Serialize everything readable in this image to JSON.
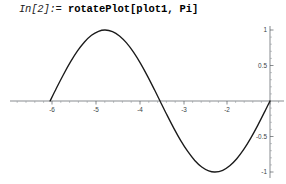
{
  "window": {
    "title": "Mathematica Notebook Cell",
    "background_color": "#ffffff"
  },
  "input_cell": {
    "prompt": "In[2]:=",
    "expression": "rotatePlot[plot1, Pi]",
    "prompt_color": "#1a1a1a",
    "expression_color": "#000000"
  },
  "chart_data": {
    "type": "line",
    "title": "",
    "subtitle": "",
    "xlabel": "",
    "ylabel": "",
    "function": "-sin(x)",
    "xlim": [
      -6.6,
      0.15
    ],
    "ylim": [
      -1.08,
      1.08
    ],
    "xticks": [
      -6,
      -5,
      -4,
      -3,
      -2,
      -1
    ],
    "xtick_labels": [
      "-6",
      "-5",
      "-4",
      "-3",
      "-2",
      "-1"
    ],
    "yticks": [
      1,
      0.5,
      -0.5,
      -1
    ],
    "ytick_labels": [
      "1",
      "0.5",
      "-0.5",
      "-1"
    ],
    "grid": false,
    "legend": "none",
    "axis_color": "#555a5e",
    "curve_color": "#1a1a1a",
    "x": [
      -6.283,
      -6.1,
      -5.9,
      -5.7,
      -5.5,
      -5.3,
      -5.1,
      -4.9,
      -4.712,
      -4.5,
      -4.3,
      -4.1,
      -3.9,
      -3.7,
      -3.5,
      -3.3,
      -3.142,
      -2.95,
      -2.75,
      -2.55,
      -2.35,
      -2.15,
      -1.95,
      -1.75,
      -1.571,
      -1.35,
      -1.15,
      -0.95,
      -0.75,
      -0.55,
      -0.35,
      -0.15,
      0
    ],
    "values": [
      0.0,
      0.183,
      0.374,
      0.551,
      0.706,
      0.832,
      0.926,
      0.982,
      1.0,
      0.978,
      0.916,
      0.818,
      0.688,
      0.53,
      0.351,
      0.158,
      0.0,
      -0.191,
      -0.382,
      -0.558,
      -0.711,
      -0.837,
      -0.929,
      -0.984,
      -1.0,
      -0.976,
      -0.913,
      -0.813,
      -0.682,
      -0.523,
      -0.343,
      -0.149,
      0.0
    ]
  }
}
